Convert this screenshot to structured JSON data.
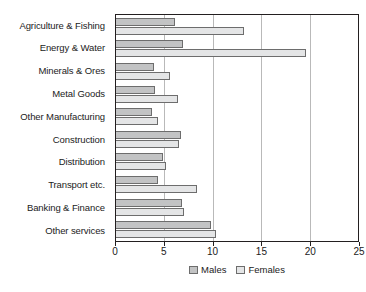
{
  "chart_data": {
    "type": "bar",
    "orientation": "horizontal",
    "title": "",
    "xlabel": "",
    "ylabel": "",
    "xlim": [
      0,
      25
    ],
    "xticks": [
      0,
      5,
      10,
      15,
      20,
      25
    ],
    "xtick_labels": [
      "0",
      "5",
      "10",
      "15",
      "20",
      "25"
    ],
    "grid": true,
    "grid_axis": "x",
    "legend_position": "bottom-center",
    "categories": [
      "Agriculture & Fishing",
      "Energy & Water",
      "Minerals & Ores",
      "Metal Goods",
      "Other Manufacturing",
      "Construction",
      "Distribution",
      "Transport etc.",
      "Banking & Finance",
      "Other services"
    ],
    "series": [
      {
        "name": "Males",
        "color": "#c2c3c4",
        "values": [
          6.1,
          6.9,
          3.9,
          4.0,
          3.7,
          6.7,
          4.9,
          4.3,
          6.8,
          9.8
        ]
      },
      {
        "name": "Females",
        "color": "#e4e5e6",
        "values": [
          13.2,
          19.6,
          5.6,
          6.4,
          4.3,
          6.5,
          5.2,
          8.4,
          7.0,
          10.3
        ]
      }
    ]
  }
}
